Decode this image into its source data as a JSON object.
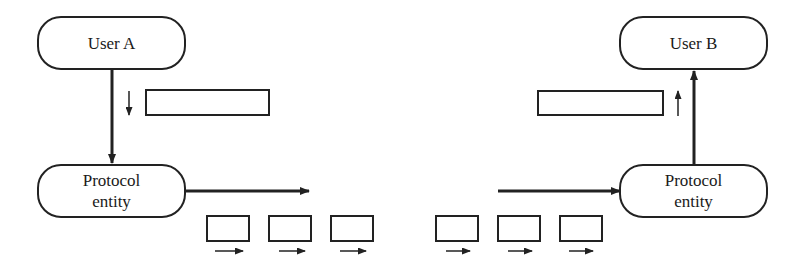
{
  "diagram": {
    "nodes": {
      "user_a": "User A",
      "user_b": "User B",
      "protocol_entity_left_line1": "Protocol",
      "protocol_entity_left_line2": "entity",
      "protocol_entity_right_line1": "Protocol",
      "protocol_entity_right_line2": "entity"
    },
    "left_packets_count": 3,
    "right_packets_count": 3,
    "colors": {
      "stroke": "#222222",
      "background": "#ffffff"
    }
  }
}
